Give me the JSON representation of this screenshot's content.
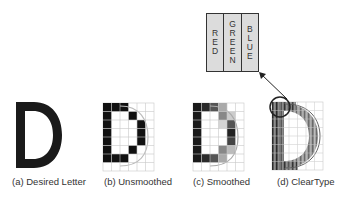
{
  "panels": [
    {
      "id": "a",
      "label": "(a) Desired Letter"
    },
    {
      "id": "b",
      "label": "(b) Unsmoothed"
    },
    {
      "id": "c",
      "label": "(c) Smoothed"
    },
    {
      "id": "d",
      "label": "(d) ClearType"
    }
  ],
  "callout": {
    "subpixels": [
      {
        "name": "RED",
        "letters": [
          "R",
          "E",
          "D"
        ]
      },
      {
        "name": "GREEN",
        "letters": [
          "G",
          "R",
          "E",
          "E",
          "N"
        ]
      },
      {
        "name": "BLUE",
        "letters": [
          "B",
          "L",
          "U",
          "E"
        ]
      }
    ]
  },
  "grid": {
    "cols": 6,
    "rows": 8,
    "cell": 8.5
  },
  "glyph": {
    "letter": "D"
  },
  "colors": {
    "ink": "#1a1a1a",
    "grid": "#c8c8c8",
    "text": "#333333"
  }
}
